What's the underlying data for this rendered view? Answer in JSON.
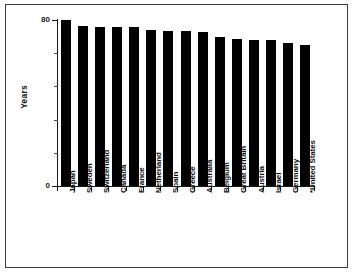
{
  "chart_data": {
    "type": "bar",
    "title": "",
    "xlabel": "",
    "ylabel": "Years",
    "ylim": [
      0,
      80
    ],
    "yticks": [
      0,
      80
    ],
    "ytick_labels": [
      "0",
      "80"
    ],
    "minor_yticks": [
      16,
      32,
      48,
      64
    ],
    "grid": false,
    "legend": null,
    "orientation": "vertical",
    "bar_color": "#000000",
    "categories": [
      "Japan",
      "Sweden",
      "Switzerland",
      "Canada",
      "France",
      "Netherland",
      "Spain",
      "Greece",
      "Australia",
      "Belgium",
      "Great Britain",
      "Austria",
      "Israel",
      "Germany",
      "*United States"
    ],
    "values": [
      80,
      77,
      76.5,
      76.5,
      76.5,
      75,
      74.5,
      74.5,
      74,
      72,
      71,
      70.5,
      70.5,
      69,
      68
    ]
  },
  "axis": {
    "y_title": "Years",
    "y_top_label": "80",
    "y_bottom_label": "0"
  }
}
